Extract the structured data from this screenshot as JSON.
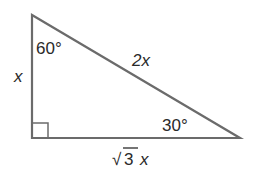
{
  "diagram": {
    "type": "right-triangle-30-60-90",
    "colors": {
      "stroke": "#6b6b6b",
      "text": "#2a2a2a",
      "background": "#ffffff"
    },
    "vertices": {
      "top": {
        "angle_label": "60°"
      },
      "bottom_left": {
        "angle": "right-angle"
      },
      "bottom_right": {
        "angle_label": "30°"
      }
    },
    "sides": {
      "left": {
        "label": "x"
      },
      "hypotenuse": {
        "label": "2x"
      },
      "bottom": {
        "label_radical": "√",
        "label_rad": "3",
        "label_var": "x"
      }
    }
  }
}
